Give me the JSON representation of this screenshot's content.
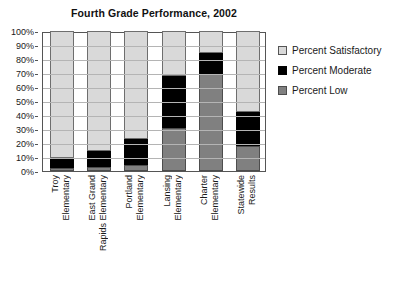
{
  "chart_data": {
    "type": "bar",
    "subtype": "stacked-column-100",
    "title": "Fourth Grade Performance, 2002",
    "xlabel": "",
    "ylabel": "",
    "ylim": [
      0,
      100
    ],
    "yticks": [
      "0%",
      "10%",
      "20%",
      "30%",
      "40%",
      "50%",
      "60%",
      "70%",
      "80%",
      "90%",
      "100%"
    ],
    "grid": true,
    "legend_position": "right",
    "categories": [
      "Troy Elementary",
      "East Grand Rapids Elementary",
      "Portland Elementary",
      "Lansing Elementary",
      "Charter Elementary",
      "Statewide Results"
    ],
    "category_lines": [
      [
        "Troy",
        "Elementary"
      ],
      [
        "East Grand",
        "Rapids Elementary"
      ],
      [
        "Portland",
        "Elementary"
      ],
      [
        "Lansing",
        "Elementary"
      ],
      [
        "Charter",
        "Elementary"
      ],
      [
        "Statewide",
        "Results"
      ]
    ],
    "series": [
      {
        "name": "Percent Low",
        "color": "#808080",
        "values": [
          2,
          3,
          4,
          31,
          69,
          18
        ]
      },
      {
        "name": "Percent Moderate",
        "color": "#000000",
        "values": [
          7,
          11,
          19,
          37,
          15,
          24
        ]
      },
      {
        "name": "Percent Satisfactory",
        "color": "#d9d9d9",
        "values": [
          91,
          86,
          77,
          32,
          16,
          58
        ]
      }
    ]
  },
  "legend": {
    "items": [
      {
        "label": "Percent Satisfactory",
        "swatch": "sat"
      },
      {
        "label": "Percent Moderate",
        "swatch": "mod"
      },
      {
        "label": "Percent Low",
        "swatch": "low"
      }
    ]
  }
}
